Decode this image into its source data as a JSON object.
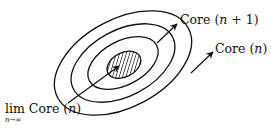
{
  "diagram": {
    "type": "nested-ellipses",
    "colors": {
      "stroke": "#111111",
      "background": "#ffffff",
      "hatch": "#111111"
    },
    "ellipses": [
      {
        "name": "outer",
        "rx": 74,
        "ry": 48
      },
      {
        "name": "middle",
        "rx": 56,
        "ry": 35
      },
      {
        "name": "inner",
        "rx": 38,
        "ry": 23
      },
      {
        "name": "core-hatched",
        "rx": 18,
        "ry": 12,
        "hatched": true
      }
    ],
    "labels": {
      "core_n_plus_1": {
        "prefix": "Core ",
        "open": "(",
        "var": "n",
        "rest": " + 1)"
      },
      "core_n": {
        "prefix": "Core ",
        "open": "(",
        "var": "n",
        "rest": ")"
      },
      "limit": {
        "lim": "lim",
        "sub_var": "n",
        "sub_arrow": "→",
        "sub_inf": "∞",
        "prefix": " Core ",
        "open": "(",
        "var": "n",
        "rest": ")"
      }
    }
  }
}
